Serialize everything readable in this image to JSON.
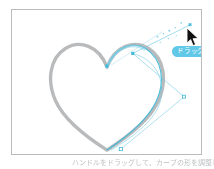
{
  "app": {
    "kind": "vector-illustration-tutorial-figure",
    "background_color": "#ffffff"
  },
  "canvas": {
    "name": "drawing-canvas",
    "border_color": "#b9bcbe",
    "fill_color": "#ffffff"
  },
  "template_shape": {
    "name": "heart-template",
    "description": "gray heart outline guide",
    "stroke_color": "#b4b6b8",
    "stroke_width": "3.4"
  },
  "vector_path": {
    "name": "bezier-path",
    "stroke_color": "#3fb8d8",
    "stroke_width": "1",
    "description": "cyan bezier curve drawn over the right half of the heart"
  },
  "handles": {
    "anchor_color": "#3fb8d8",
    "handle_line_color": "#6fc9e4",
    "points": [
      {
        "name": "anchor-heart-center-notch",
        "x": 107,
        "y": 64
      },
      {
        "name": "anchor-heart-right-top",
        "x": 126,
        "y": 47
      },
      {
        "name": "anchor-heart-bottom-tip",
        "x": 110,
        "y": 148
      },
      {
        "name": "handle-upper-right",
        "x": 183,
        "y": 23
      },
      {
        "name": "handle-lower-right",
        "x": 177,
        "y": 89
      }
    ]
  },
  "motion_trail": {
    "name": "drag-motion-trail",
    "color": "#6fc9e4",
    "description": "dotted sparkle trail along the drag direction"
  },
  "badge": {
    "name": "drag-badge",
    "label": "ドラッグ",
    "background_color": "#62c8e8",
    "text_color": "#ffffff"
  },
  "cursor": {
    "name": "arrow-cursor",
    "icon": "arrow-pointer-icon",
    "color": "#111111"
  },
  "caption": {
    "name": "figure-caption",
    "text": "ハンドルをドラッグして、カーブの形を調整します"
  }
}
